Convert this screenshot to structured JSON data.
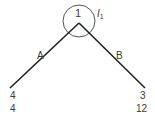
{
  "diagram": {
    "root": {
      "label": "1",
      "annotation": "I",
      "annotation_sub": "1"
    },
    "edges": [
      {
        "label": "A",
        "side": "left"
      },
      {
        "label": "B",
        "side": "right"
      }
    ],
    "leaves": [
      {
        "side": "left",
        "top_value": "4",
        "bottom_value": "4"
      },
      {
        "side": "right",
        "top_value": "3",
        "bottom_value": "12"
      }
    ],
    "colors": {
      "lines": "#222222",
      "circle": "#555555",
      "text": "#3a3a3a"
    }
  }
}
